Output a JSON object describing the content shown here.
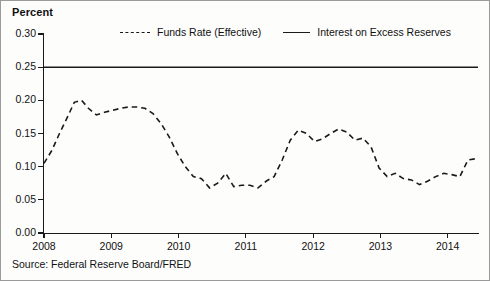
{
  "figure": {
    "y_axis_title": "Percent",
    "source_note": "Source: Federal Reserve Board/FRED",
    "background_color": "#fdfdfc",
    "ink_color": "#1a1a1a",
    "border_color": "#9a9a9a"
  },
  "legend": {
    "position": "top-inside",
    "entries": [
      {
        "label": "Funds Rate (Effective)",
        "style": "dashed",
        "marker": "dashed-line-swatch"
      },
      {
        "label": "Interest on Excess Reserves",
        "style": "solid",
        "marker": "solid-line-swatch"
      }
    ]
  },
  "axes": {
    "y_ticks": [
      "0.00",
      "0.05",
      "0.10",
      "0.15",
      "0.20",
      "0.25",
      "0.30"
    ],
    "x_ticks": [
      "2008",
      "2009",
      "2010",
      "2011",
      "2012",
      "2013",
      "2014"
    ]
  },
  "chart_data": {
    "type": "line",
    "title": "",
    "subtitle": "",
    "xlabel": "",
    "ylabel": "Percent",
    "xlim": [
      2008.0,
      2014.45
    ],
    "ylim": [
      0.0,
      0.3
    ],
    "ytick_values": [
      0.0,
      0.05,
      0.1,
      0.15,
      0.2,
      0.25,
      0.3
    ],
    "xtick_values": [
      2008,
      2009,
      2010,
      2011,
      2012,
      2013,
      2014
    ],
    "grid": false,
    "legend_position": "top-center-inside",
    "annotations": [
      "Source: Federal Reserve Board/FRED"
    ],
    "series": [
      {
        "name": "Interest on Excess Reserves",
        "style": "solid",
        "color": "#1a1a1a",
        "x": [
          2008.0,
          2014.45
        ],
        "values": [
          0.25,
          0.25
        ]
      },
      {
        "name": "Funds Rate (Effective)",
        "style": "dashed",
        "color": "#1a1a1a",
        "x": [
          2008.0,
          2008.12,
          2008.23,
          2008.35,
          2008.45,
          2008.56,
          2008.66,
          2008.78,
          2008.9,
          2009.02,
          2009.14,
          2009.26,
          2009.38,
          2009.5,
          2009.62,
          2009.74,
          2009.86,
          2009.98,
          2010.1,
          2010.22,
          2010.34,
          2010.46,
          2010.58,
          2010.7,
          2010.82,
          2010.94,
          2011.06,
          2011.18,
          2011.3,
          2011.42,
          2011.54,
          2011.66,
          2011.78,
          2011.9,
          2012.02,
          2012.14,
          2012.26,
          2012.38,
          2012.5,
          2012.62,
          2012.74,
          2012.86,
          2012.98,
          2013.1,
          2013.22,
          2013.34,
          2013.46,
          2013.58,
          2013.7,
          2013.82,
          2013.94,
          2014.06,
          2014.18,
          2014.3,
          2014.42
        ],
        "values": [
          0.105,
          0.125,
          0.15,
          0.175,
          0.197,
          0.2,
          0.188,
          0.178,
          0.182,
          0.185,
          0.188,
          0.19,
          0.19,
          0.188,
          0.18,
          0.165,
          0.145,
          0.12,
          0.1,
          0.085,
          0.082,
          0.068,
          0.075,
          0.09,
          0.07,
          0.072,
          0.072,
          0.068,
          0.078,
          0.085,
          0.11,
          0.14,
          0.155,
          0.15,
          0.138,
          0.142,
          0.15,
          0.157,
          0.152,
          0.14,
          0.143,
          0.13,
          0.098,
          0.085,
          0.09,
          0.082,
          0.08,
          0.073,
          0.078,
          0.085,
          0.09,
          0.088,
          0.085,
          0.11,
          0.112
        ]
      }
    ]
  }
}
